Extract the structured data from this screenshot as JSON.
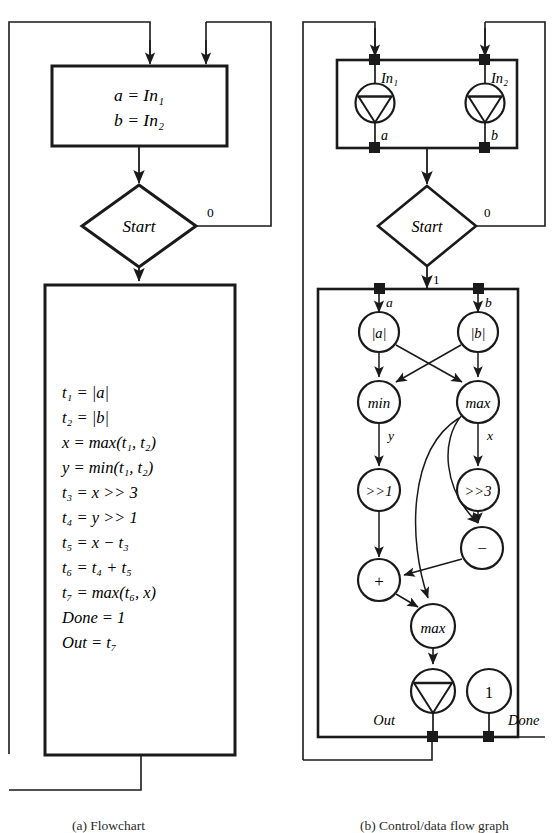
{
  "figure": {
    "caption_a": "(a)  Flowchart",
    "caption_b": "(b)  Control/data flow graph"
  },
  "flowchart": {
    "assign_box": {
      "lines": [
        "a = In₁",
        "b = In₂"
      ]
    },
    "decision": {
      "label": "Start",
      "branch_false": "0"
    },
    "body_box": {
      "lines": [
        "t₁ = |a|",
        "t₂ = |b|",
        "x = max(t₁, t₂)",
        "y = min(t₁, t₂)",
        "t₃ = x >> 3",
        "t₄ = y >> 1",
        "t₅ = x − t₃",
        "t₆ = t₄ + t₅",
        "t₇ = max(t₆, x)",
        "Done = 1",
        "Out = t₇"
      ]
    }
  },
  "cdfg": {
    "input_box": {
      "ports": [
        "In₁",
        "In₂"
      ],
      "outputs": [
        "a",
        "b"
      ]
    },
    "decision": {
      "label": "Start",
      "branch_false": "0",
      "branch_true": "1"
    },
    "body": {
      "inputs": [
        "a",
        "b"
      ],
      "nodes": [
        {
          "id": "abs_a",
          "label": "|a|"
        },
        {
          "id": "abs_b",
          "label": "|b|"
        },
        {
          "id": "min",
          "label": "min"
        },
        {
          "id": "max_top",
          "label": "max"
        },
        {
          "id": "shr1",
          "label": ">>1"
        },
        {
          "id": "shr3",
          "label": ">>3"
        },
        {
          "id": "sub",
          "label": "−"
        },
        {
          "id": "add",
          "label": "+"
        },
        {
          "id": "max_bot",
          "label": "max"
        },
        {
          "id": "one",
          "label": "1"
        }
      ],
      "edge_labels": {
        "min_out": "y",
        "max_out": "x"
      },
      "outputs": [
        "Out",
        "Done"
      ]
    }
  }
}
